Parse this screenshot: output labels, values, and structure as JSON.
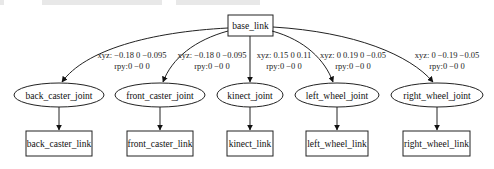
{
  "diagram": {
    "type": "urdf-tree",
    "root": {
      "id": "base_link",
      "label": "base_link",
      "shape": "box"
    },
    "joints": [
      {
        "id": "back_caster_joint",
        "label": "back_caster_joint",
        "xyz": "xyz: −0.18 0 −0.095",
        "rpy": "rpy:0 −0 0",
        "child": "back_caster_link"
      },
      {
        "id": "front_caster_joint",
        "label": "front_caster_joint",
        "xyz": "xyz: −0.18 0 −0.095",
        "rpy": "rpy:0 −0 0",
        "child": "front_caster_link"
      },
      {
        "id": "kinect_joint",
        "label": "kinect_joint",
        "xyz": "xyz: 0.15 0 0.11",
        "rpy": "rpy:0 −0 0",
        "child": "kinect_link"
      },
      {
        "id": "left_wheel_joint",
        "label": "left_wheel_joint",
        "xyz": "xyz: 0 0.19 0 −0.05",
        "rpy": "rpy:0 −0 0",
        "child": "left_wheel_link"
      },
      {
        "id": "right_wheel_joint",
        "label": "right_wheel_joint",
        "xyz": "xyz: 0 −0.19 −0.05",
        "rpy": "rpy:0 −0 0",
        "child": "right_wheel_link"
      }
    ],
    "links": [
      {
        "id": "back_caster_link",
        "label": "back_caster_link"
      },
      {
        "id": "front_caster_link",
        "label": "front_caster_link"
      },
      {
        "id": "kinect_link",
        "label": "kinect_link"
      },
      {
        "id": "left_wheel_link",
        "label": "left_wheel_link"
      },
      {
        "id": "right_wheel_link",
        "label": "right_wheel_link"
      }
    ]
  }
}
